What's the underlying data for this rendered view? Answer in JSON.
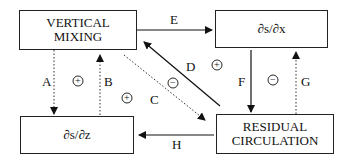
{
  "nodes": {
    "vertical_mixing": "VERTICAL MIXING",
    "ds_dx": "∂s/∂x",
    "ds_dz": "∂s/∂z",
    "residual_circulation": "RESIDUAL CIRCULATION"
  },
  "edges": {
    "A": "A",
    "B": "B",
    "C": "C",
    "D": "D",
    "E": "E",
    "F": "F",
    "G": "G",
    "H": "H"
  },
  "loops": {
    "left": "+",
    "center": "+",
    "center_neg": "−",
    "upper_right": "+",
    "right": "−"
  }
}
